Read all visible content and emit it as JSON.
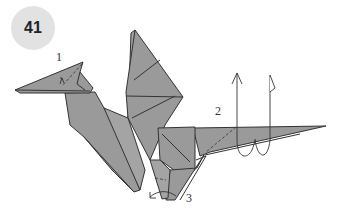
{
  "step": {
    "number": "41",
    "badge_color": "#e2e2e2"
  },
  "labels": {
    "one": "1",
    "two": "2",
    "three": "3"
  },
  "colors": {
    "paper": "#9a9a9a",
    "paper_light": "#a8a8a8",
    "line": "#333333"
  },
  "figure": {
    "steps": [
      "1: fold head tip (crimp)",
      "2: pleat/crimp tail",
      "3: reverse fold foot"
    ]
  }
}
